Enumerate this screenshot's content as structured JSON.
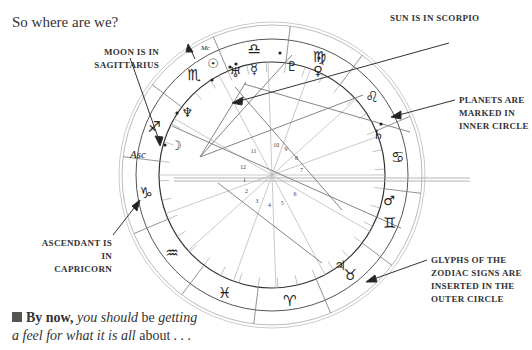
{
  "title": "So where are we?",
  "callouts": {
    "moon": [
      "MOON IS IN",
      "SAGITTARIUS"
    ],
    "sun": [
      "SUN IS IN SCORPIO"
    ],
    "planets": [
      "PLANETS ARE",
      "MARKED IN",
      "INNER CIRCLE"
    ],
    "ascendant": [
      "ASCENDANT IS IN",
      "CAPRICORN"
    ],
    "glyphs": [
      "GLYPHS OF THE",
      "ZODIAC SIGNS ARE",
      "INSERTED IN THE",
      "OUTER CIRCLE"
    ]
  },
  "footer": {
    "bold_lead": "By now,",
    "italic_1": " you should",
    "plain_1": " be",
    "italic_2": " getting",
    "line2_italic": "a feel for what it is all",
    "line2_plain": " about",
    "line2_end": " . . ."
  },
  "chart": {
    "zodiac_signs": [
      {
        "name": "libra",
        "glyph": "♎"
      },
      {
        "name": "virgo",
        "glyph": "♍"
      },
      {
        "name": "leo",
        "glyph": "♌"
      },
      {
        "name": "cancer",
        "glyph": "♋"
      },
      {
        "name": "gemini",
        "glyph": "♊"
      },
      {
        "name": "taurus",
        "glyph": "♉"
      },
      {
        "name": "aries",
        "glyph": "♈"
      },
      {
        "name": "pisces",
        "glyph": "♓"
      },
      {
        "name": "aquarius",
        "glyph": "♒"
      },
      {
        "name": "capricorn",
        "glyph": "♑"
      },
      {
        "name": "sagittarius",
        "glyph": "♐"
      },
      {
        "name": "scorpio",
        "glyph": "♏"
      }
    ],
    "planets": [
      {
        "name": "sun",
        "glyph": "☉"
      },
      {
        "name": "uranus",
        "glyph": "♅"
      },
      {
        "name": "mercury",
        "glyph": "☿"
      },
      {
        "name": "pluto",
        "glyph": "♇"
      },
      {
        "name": "venus",
        "glyph": "♀"
      },
      {
        "name": "saturn",
        "glyph": "♄"
      },
      {
        "name": "mars",
        "glyph": "♂"
      },
      {
        "name": "jupiter",
        "glyph": "♃"
      },
      {
        "name": "moon",
        "glyph": "☽"
      },
      {
        "name": "neptune",
        "glyph": "♆"
      }
    ],
    "labels": {
      "asc": "Asc",
      "mc": "Mc"
    },
    "house_numbers": [
      "1",
      "2",
      "3",
      "4",
      "5",
      "6",
      "7",
      "8",
      "9",
      "10",
      "11",
      "12"
    ]
  }
}
